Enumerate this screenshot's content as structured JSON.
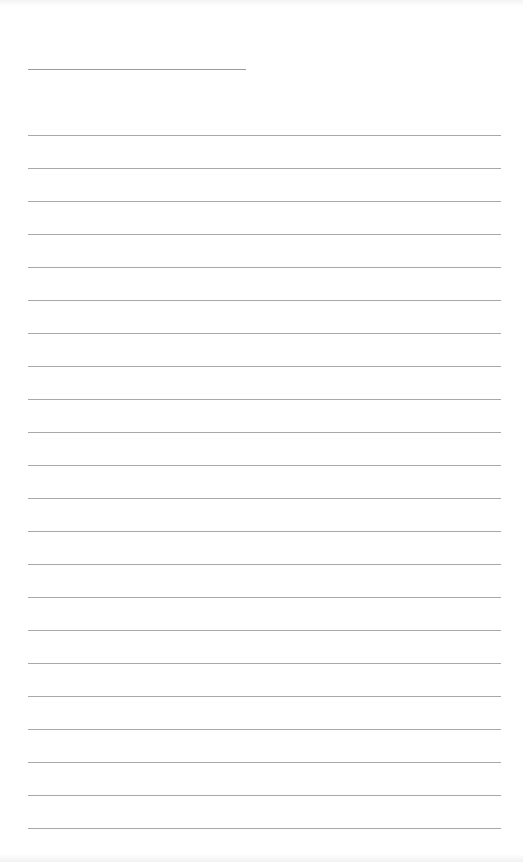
{
  "page": {
    "type": "blank-lined-page",
    "background": "#ffffff",
    "line_color": "#a8a8a8"
  },
  "title_field": {
    "value": "",
    "line_count": 1
  },
  "ruled_area": {
    "line_count": 22,
    "lines": [
      "",
      "",
      "",
      "",
      "",
      "",
      "",
      "",
      "",
      "",
      "",
      "",
      "",
      "",
      "",
      "",
      "",
      "",
      "",
      "",
      "",
      ""
    ]
  }
}
